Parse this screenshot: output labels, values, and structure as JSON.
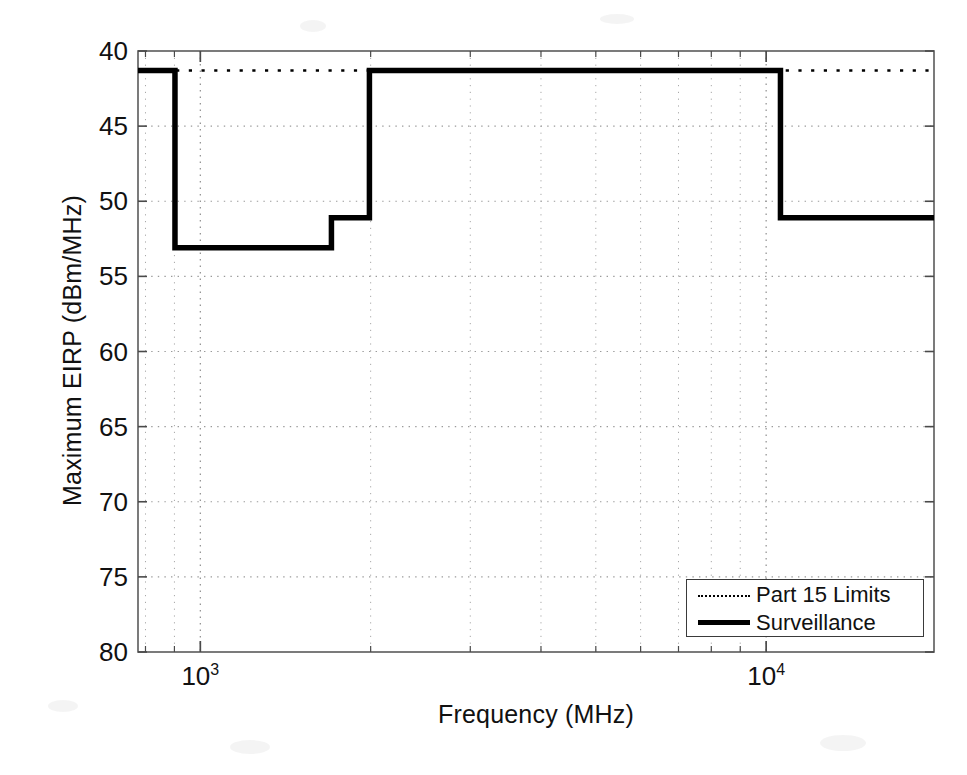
{
  "chart_data": {
    "type": "line",
    "title": "",
    "xlabel": "Frequency  (MHz)",
    "ylabel": "Maximum EIRP (dBm/MHz)",
    "xscale": "log",
    "xlim": [
      776,
      19800
    ],
    "ylim_display": [
      40,
      80
    ],
    "y_axis_inverted": true,
    "y_value_sign": "negative (axis shows magnitude of dBm/MHz)",
    "grid": true,
    "grid_style": "dotted",
    "xticks": [
      1000,
      10000
    ],
    "xtick_labels": [
      "10^3",
      "10^4"
    ],
    "yticks": [
      40,
      45,
      50,
      55,
      60,
      65,
      70,
      75,
      80
    ],
    "ytick_labels": [
      "40",
      "45",
      "50",
      "55",
      "60",
      "65",
      "70",
      "75",
      "80"
    ],
    "legend_position": "lower right",
    "series": [
      {
        "name": "Part 15 Limits",
        "style": "dotted",
        "color": "#000000",
        "linewidth": 2.6,
        "step_points": [
          {
            "freq": 776,
            "level": 41.3
          },
          {
            "freq": 19800,
            "level": 41.3
          }
        ]
      },
      {
        "name": "Surveillance",
        "style": "solid",
        "color": "#000000",
        "linewidth": 5.5,
        "step_points": [
          {
            "freq": 776,
            "level": 41.3
          },
          {
            "freq": 902,
            "level": 41.3
          },
          {
            "freq": 902,
            "level": 53.1
          },
          {
            "freq": 1705,
            "level": 53.1
          },
          {
            "freq": 1705,
            "level": 51.1
          },
          {
            "freq": 1990,
            "level": 51.1
          },
          {
            "freq": 1990,
            "level": 41.3
          },
          {
            "freq": 10600,
            "level": 41.3
          },
          {
            "freq": 10600,
            "level": 51.1
          },
          {
            "freq": 19800,
            "level": 51.1
          }
        ]
      }
    ]
  },
  "legend": {
    "entries": [
      {
        "label": "Part 15 Limits",
        "marker": "dotted-line"
      },
      {
        "label": "Surveillance",
        "marker": "solid-line"
      }
    ]
  }
}
